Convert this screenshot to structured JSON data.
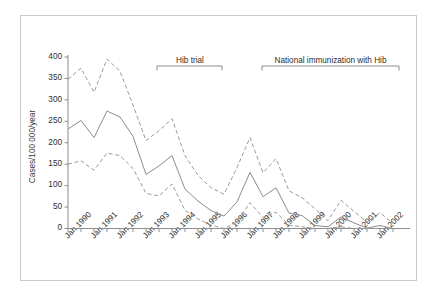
{
  "figure": {
    "border_color": "#c9c9c9",
    "background": "#ffffff"
  },
  "chart_data": {
    "type": "line",
    "title": "",
    "subtitle": "",
    "xlabel": "",
    "ylabel": "Cases/100 000/year",
    "ylim": [
      0,
      400
    ],
    "ytick_values": [
      0,
      50,
      100,
      150,
      200,
      250,
      300,
      350,
      400
    ],
    "ytick_labels": [
      "0",
      "50",
      "100",
      "150",
      "200",
      "250",
      "300",
      "350",
      "400"
    ],
    "grid": false,
    "legend_position": "none",
    "xlim": [
      "Jan 1990",
      "Jan 2003"
    ],
    "xtick_labels": [
      "Jan 1990",
      "Jan 1991",
      "Jan 1992",
      "Jan 1993",
      "Jan 1994",
      "Jan 1995",
      "Jan 1996",
      "Jan 1997",
      "Jan 1998",
      "Jan 1999",
      "Jan 2000",
      "Jan 2001",
      "Jan 2002"
    ],
    "x": [
      1990.0,
      1990.5,
      1991.0,
      1991.5,
      1992.0,
      1992.5,
      1993.0,
      1993.5,
      1994.0,
      1994.5,
      1995.0,
      1995.5,
      1996.0,
      1996.5,
      1997.0,
      1997.5,
      1998.0,
      1998.5,
      1999.0,
      1999.5,
      2000.0,
      2000.5,
      2001.0,
      2001.5,
      2002.0,
      2002.5
    ],
    "series": [
      {
        "name": "Upper 95% confidence limit",
        "style": "dashed",
        "color": "#9a9a9a",
        "values": [
          348,
          374,
          318,
          395,
          367,
          288,
          205,
          228,
          256,
          170,
          124,
          95,
          80,
          142,
          212,
          130,
          163,
          88,
          72,
          46,
          18,
          66,
          40,
          15,
          37,
          12
        ]
      },
      {
        "name": "Incidence rate",
        "style": "solid",
        "color": "#8d8d8d",
        "values": [
          232,
          252,
          212,
          274,
          260,
          215,
          126,
          146,
          170,
          92,
          64,
          42,
          29,
          62,
          131,
          74,
          95,
          36,
          30,
          7,
          4,
          27,
          13,
          1,
          7,
          0
        ]
      },
      {
        "name": "Lower 95% confidence limit",
        "style": "dashed",
        "color": "#9a9a9a",
        "values": [
          150,
          158,
          136,
          176,
          170,
          140,
          82,
          76,
          104,
          42,
          22,
          8,
          0,
          15,
          60,
          26,
          38,
          8,
          4,
          0,
          0,
          4,
          0,
          0,
          0,
          0
        ]
      }
    ],
    "annotations": [
      {
        "label": "Hib trial",
        "start": "Jan 1993",
        "end": "Jan 1996",
        "bracket": true
      },
      {
        "label": "National immunization with Hib",
        "start": "Jan 1997",
        "end": "Jan 2002",
        "bracket": true
      }
    ]
  }
}
